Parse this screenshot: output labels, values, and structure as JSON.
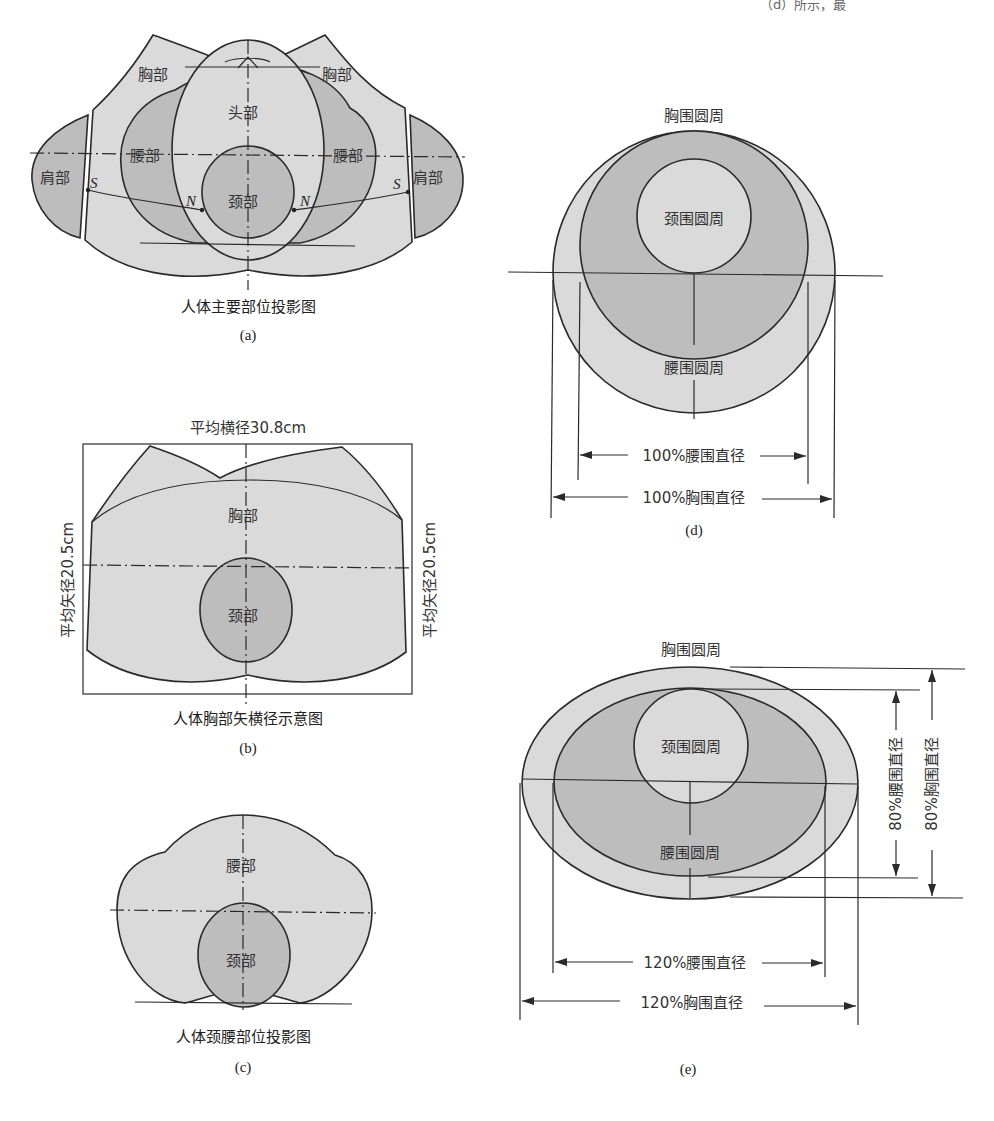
{
  "page": {
    "top_cut_text": "（d）所示，最"
  },
  "colors": {
    "light_fill": "#dadada",
    "dark_fill": "#bdbdbd",
    "line": "#2a2a2a",
    "background": "#ffffff"
  },
  "figures": {
    "a": {
      "caption": "人体主要部位投影图",
      "tag": "(a)",
      "labels": {
        "chest_left": "胸部",
        "chest_right": "胸部",
        "head": "头部",
        "waist_left": "腰部",
        "waist_right": "腰部",
        "shoulder_left": "肩部",
        "shoulder_right": "肩部",
        "neck": "颈部",
        "point_s_left": "S",
        "point_s_right": "S",
        "point_n_left": "N",
        "point_n_right": "N"
      }
    },
    "b": {
      "caption": "人体胸部矢横径示意图",
      "tag": "(b)",
      "labels": {
        "top_dimension": "平均横径30.8cm",
        "left_dimension": "平均矢径20.5cm",
        "right_dimension": "平均矢径20.5cm",
        "chest": "胸部",
        "neck": "颈部"
      }
    },
    "c": {
      "caption": "人体颈腰部位投影图",
      "tag": "(c)",
      "labels": {
        "waist": "腰部",
        "neck": "颈部"
      }
    },
    "d": {
      "tag": "(d)",
      "labels": {
        "chest_circle": "胸围圆周",
        "neck_circle": "颈围圆周",
        "waist_circle": "腰围圆周",
        "waist_diameter": "100%腰围直径",
        "chest_diameter": "100%胸围直径"
      }
    },
    "e": {
      "tag": "(e)",
      "labels": {
        "chest_circle": "胸围圆周",
        "neck_circle": "颈围圆周",
        "waist_circle": "腰围圆周",
        "waist_h_diameter": "120%腰围直径",
        "chest_h_diameter": "120%胸围直径",
        "waist_v_diameter": "80%腰围直径",
        "chest_v_diameter": "80%胸围直径"
      }
    }
  }
}
